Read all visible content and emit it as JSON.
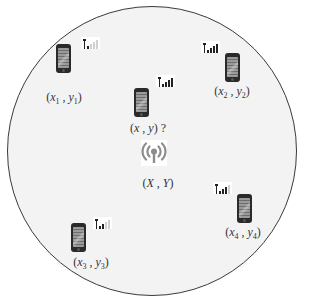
{
  "diagram": {
    "title": "",
    "colors": {
      "field_fill": "#f3f3f3",
      "field_stroke": "#3a3a3a",
      "phone_body": "#2a2a2a",
      "signal_bar": "#222222",
      "tower_icon": "#8c8c8c",
      "text": "#333333"
    },
    "anchor": {
      "icon": "broadcast-tower-icon",
      "label_open": "(",
      "label_x": "X",
      "label_sep": " , ",
      "label_y": "Y",
      "label_close": ")"
    },
    "unknown_node": {
      "icon": "smartphone-icon",
      "signal_bars": 4,
      "label_open": "(",
      "label_x": "x",
      "label_sep": " , ",
      "label_y": "y",
      "label_close": ")",
      "label_suffix": " ?"
    },
    "nodes": [
      {
        "id": 1,
        "icon": "smartphone-icon",
        "signal_bars": 1,
        "label_x": "x",
        "sub_x": "1",
        "label_y": "y",
        "sub_y": "1"
      },
      {
        "id": 2,
        "icon": "smartphone-icon",
        "signal_bars": 4,
        "label_x": "x",
        "sub_x": "2",
        "label_y": "y",
        "sub_y": "2"
      },
      {
        "id": 3,
        "icon": "smartphone-icon",
        "signal_bars": 2,
        "label_x": "x",
        "sub_x": "3",
        "label_y": "y",
        "sub_y": "3"
      },
      {
        "id": 4,
        "icon": "smartphone-icon",
        "signal_bars": 3,
        "label_x": "x",
        "sub_x": "4",
        "label_y": "y",
        "sub_y": "4"
      }
    ],
    "punct": {
      "open": "(",
      "sep": " , ",
      "close": ")"
    }
  }
}
